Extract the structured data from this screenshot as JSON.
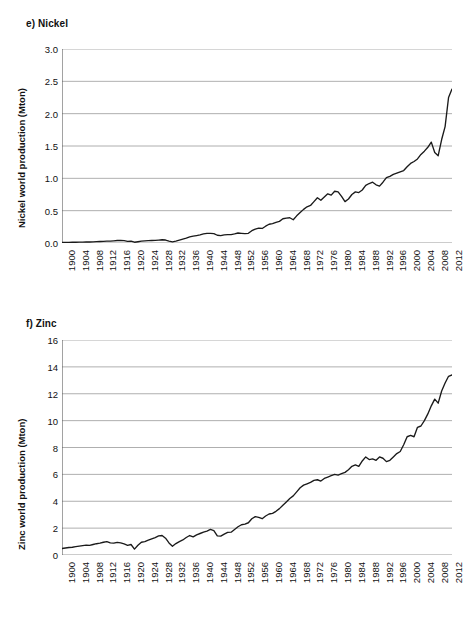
{
  "figure": {
    "background": "#ffffff",
    "line_color": "#1a1a1a",
    "grid_color": "#9a9a9a",
    "axis_color": "#555555"
  },
  "panels": [
    {
      "id": "nickel",
      "label": "e) Nickel",
      "ylabel": "Nickel world production (Mton)"
    },
    {
      "id": "zinc",
      "label": "f) Zinc",
      "ylabel": "Zinc world production (Mton)"
    }
  ],
  "chart_data": [
    {
      "type": "line",
      "title": "e) Nickel",
      "xlabel": "",
      "ylabel": "Nickel world production (Mton)",
      "ylim": [
        0.0,
        3.0
      ],
      "yticks": [
        "0.0",
        "0.5",
        "1.0",
        "1.5",
        "2.0",
        "2.5",
        "3.0"
      ],
      "ytick_values": [
        0.0,
        0.5,
        1.0,
        1.5,
        2.0,
        2.5,
        3.0
      ],
      "xlim": [
        1900,
        2013
      ],
      "xticks": [
        "1900",
        "1904",
        "1908",
        "1912",
        "1916",
        "1920",
        "1924",
        "1928",
        "1932",
        "1936",
        "1940",
        "1944",
        "1948",
        "1952",
        "1956",
        "1960",
        "1964",
        "1968",
        "1972",
        "1976",
        "1980",
        "1984",
        "1988",
        "1992",
        "1996",
        "2000",
        "2004",
        "2008",
        "2012"
      ],
      "xtick_values": [
        1900,
        1904,
        1908,
        1912,
        1916,
        1920,
        1924,
        1928,
        1932,
        1936,
        1940,
        1944,
        1948,
        1952,
        1956,
        1960,
        1964,
        1968,
        1972,
        1976,
        1980,
        1984,
        1988,
        1992,
        1996,
        2000,
        2004,
        2008,
        2012
      ],
      "grid": "horizontal",
      "legend": "none",
      "x": [
        1900,
        1901,
        1902,
        1903,
        1904,
        1905,
        1906,
        1907,
        1908,
        1909,
        1910,
        1911,
        1912,
        1913,
        1914,
        1915,
        1916,
        1917,
        1918,
        1919,
        1920,
        1921,
        1922,
        1923,
        1924,
        1925,
        1926,
        1927,
        1928,
        1929,
        1930,
        1931,
        1932,
        1933,
        1934,
        1935,
        1936,
        1937,
        1938,
        1939,
        1940,
        1941,
        1942,
        1943,
        1944,
        1945,
        1946,
        1947,
        1948,
        1949,
        1950,
        1951,
        1952,
        1953,
        1954,
        1955,
        1956,
        1957,
        1958,
        1959,
        1960,
        1961,
        1962,
        1963,
        1964,
        1965,
        1966,
        1967,
        1968,
        1969,
        1970,
        1971,
        1972,
        1973,
        1974,
        1975,
        1976,
        1977,
        1978,
        1979,
        1980,
        1981,
        1982,
        1983,
        1984,
        1985,
        1986,
        1987,
        1988,
        1989,
        1990,
        1991,
        1992,
        1993,
        1994,
        1995,
        1996,
        1997,
        1998,
        1999,
        2000,
        2001,
        2002,
        2003,
        2004,
        2005,
        2006,
        2007,
        2008,
        2009,
        2010,
        2011,
        2012,
        2013
      ],
      "y": [
        0.008,
        0.009,
        0.01,
        0.011,
        0.012,
        0.013,
        0.014,
        0.015,
        0.016,
        0.018,
        0.021,
        0.023,
        0.026,
        0.029,
        0.028,
        0.033,
        0.038,
        0.04,
        0.036,
        0.024,
        0.03,
        0.012,
        0.02,
        0.028,
        0.032,
        0.036,
        0.038,
        0.04,
        0.045,
        0.05,
        0.046,
        0.03,
        0.018,
        0.03,
        0.045,
        0.06,
        0.075,
        0.095,
        0.105,
        0.115,
        0.125,
        0.14,
        0.15,
        0.15,
        0.145,
        0.12,
        0.115,
        0.125,
        0.13,
        0.13,
        0.14,
        0.155,
        0.15,
        0.145,
        0.15,
        0.19,
        0.215,
        0.23,
        0.225,
        0.26,
        0.29,
        0.3,
        0.32,
        0.335,
        0.375,
        0.385,
        0.39,
        0.36,
        0.42,
        0.47,
        0.52,
        0.56,
        0.58,
        0.64,
        0.7,
        0.66,
        0.71,
        0.76,
        0.74,
        0.8,
        0.79,
        0.72,
        0.64,
        0.68,
        0.75,
        0.79,
        0.78,
        0.82,
        0.89,
        0.92,
        0.94,
        0.9,
        0.88,
        0.94,
        1.01,
        1.03,
        1.06,
        1.08,
        1.1,
        1.12,
        1.18,
        1.23,
        1.26,
        1.3,
        1.37,
        1.42,
        1.48,
        1.56,
        1.4,
        1.35,
        1.6,
        1.8,
        2.25,
        2.38
      ],
      "notes": "Annual world nickel production; near zero until 1930s, steady climb post-1950, plateau with dips in late 1970s/early 1980s, sharp rise after 2009 peaking near 2.4-2.6 Mton."
    },
    {
      "type": "line",
      "title": "f) Zinc",
      "xlabel": "",
      "ylabel": "Zinc world production (Mton)",
      "ylim": [
        0,
        16
      ],
      "yticks": [
        "0",
        "2",
        "4",
        "6",
        "8",
        "10",
        "12",
        "14",
        "16"
      ],
      "ytick_values": [
        0,
        2,
        4,
        6,
        8,
        10,
        12,
        14,
        16
      ],
      "xlim": [
        1900,
        2013
      ],
      "xticks": [
        "1900",
        "1904",
        "1908",
        "1912",
        "1916",
        "1920",
        "1924",
        "1928",
        "1932",
        "1936",
        "1940",
        "1944",
        "1948",
        "1952",
        "1956",
        "1960",
        "1964",
        "1968",
        "1972",
        "1976",
        "1980",
        "1984",
        "1988",
        "1992",
        "1996",
        "2000",
        "2004",
        "2008",
        "2012"
      ],
      "xtick_values": [
        1900,
        1904,
        1908,
        1912,
        1916,
        1920,
        1924,
        1928,
        1932,
        1936,
        1940,
        1944,
        1948,
        1952,
        1956,
        1960,
        1964,
        1968,
        1972,
        1976,
        1980,
        1984,
        1988,
        1992,
        1996,
        2000,
        2004,
        2008,
        2012
      ],
      "grid": "horizontal",
      "legend": "none",
      "x": [
        1900,
        1901,
        1902,
        1903,
        1904,
        1905,
        1906,
        1907,
        1908,
        1909,
        1910,
        1911,
        1912,
        1913,
        1914,
        1915,
        1916,
        1917,
        1918,
        1919,
        1920,
        1921,
        1922,
        1923,
        1924,
        1925,
        1926,
        1927,
        1928,
        1929,
        1930,
        1931,
        1932,
        1933,
        1934,
        1935,
        1936,
        1937,
        1938,
        1939,
        1940,
        1941,
        1942,
        1943,
        1944,
        1945,
        1946,
        1947,
        1948,
        1949,
        1950,
        1951,
        1952,
        1953,
        1954,
        1955,
        1956,
        1957,
        1958,
        1959,
        1960,
        1961,
        1962,
        1963,
        1964,
        1965,
        1966,
        1967,
        1968,
        1969,
        1970,
        1971,
        1972,
        1973,
        1974,
        1975,
        1976,
        1977,
        1978,
        1979,
        1980,
        1981,
        1982,
        1983,
        1984,
        1985,
        1986,
        1987,
        1988,
        1989,
        1990,
        1991,
        1992,
        1993,
        1994,
        1995,
        1996,
        1997,
        1998,
        1999,
        2000,
        2001,
        2002,
        2003,
        2004,
        2005,
        2006,
        2007,
        2008,
        2009,
        2010,
        2011,
        2012,
        2013
      ],
      "y": [
        0.48,
        0.52,
        0.56,
        0.58,
        0.62,
        0.66,
        0.7,
        0.74,
        0.72,
        0.78,
        0.84,
        0.88,
        0.95,
        1.0,
        0.9,
        0.88,
        0.94,
        0.9,
        0.82,
        0.72,
        0.78,
        0.44,
        0.72,
        0.95,
        1.0,
        1.1,
        1.2,
        1.3,
        1.42,
        1.45,
        1.25,
        0.9,
        0.65,
        0.85,
        1.0,
        1.12,
        1.3,
        1.45,
        1.35,
        1.5,
        1.6,
        1.7,
        1.78,
        1.9,
        1.82,
        1.42,
        1.4,
        1.55,
        1.68,
        1.7,
        1.9,
        2.1,
        2.25,
        2.3,
        2.4,
        2.7,
        2.85,
        2.8,
        2.7,
        2.9,
        3.05,
        3.1,
        3.25,
        3.45,
        3.7,
        3.95,
        4.2,
        4.4,
        4.7,
        5.0,
        5.2,
        5.3,
        5.4,
        5.55,
        5.6,
        5.5,
        5.7,
        5.8,
        5.9,
        6.0,
        5.95,
        6.05,
        6.15,
        6.35,
        6.6,
        6.7,
        6.6,
        7.0,
        7.3,
        7.1,
        7.15,
        7.05,
        7.3,
        7.2,
        6.95,
        7.05,
        7.3,
        7.55,
        7.7,
        8.2,
        8.8,
        8.9,
        8.8,
        9.5,
        9.6,
        10.0,
        10.5,
        11.1,
        11.6,
        11.3,
        12.2,
        12.8,
        13.3,
        13.4
      ],
      "notes": "Annual world zinc production; starts near 0.5 Mton, WWI and Depression dips (0.44 in 1921, 0.65 in 1932), steady growth after 1945, plateau around 7 Mton in the 1980s-90s, strong rise after 1999 reaching about 13.4 Mton."
    }
  ]
}
